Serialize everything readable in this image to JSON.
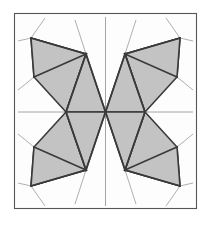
{
  "figure": {
    "name": "butterfly-crease-pattern",
    "width": 211,
    "height": 229,
    "background": "#ffffff"
  },
  "colors": {
    "background": "#ffffff",
    "sheet_fill": "#fdfdfd",
    "sheet_border": "#555555",
    "facet_fill": "#c3c3c3",
    "facet_stroke": "#3a3a3a",
    "fold_line": "#3a3a3a",
    "crease_thin": "#9a9a9a",
    "axis_line": "#8e8e8e"
  },
  "geometry": {
    "sheet": {
      "x": 14,
      "y": 13,
      "width": 183,
      "height": 196
    },
    "center": {
      "x": 105.5,
      "y": 112
    },
    "stroke_widths": {
      "sheet_border": 1.1,
      "facet": 1.6,
      "fold": 1.6,
      "crease_thin": 0.8,
      "axis": 0.8
    }
  },
  "facets": [
    {
      "name": "upper-left-outer-wing",
      "points": "31,38 86,54 34,77"
    },
    {
      "name": "upper-left-inner-wing",
      "points": "31,38 34,77 66,112 86,54"
    },
    {
      "name": "upper-left-center-fan",
      "points": "86,54 66,112 105.5,112"
    },
    {
      "name": "upper-right-outer-wing",
      "points": "180,38 125,54 177,77"
    },
    {
      "name": "upper-right-inner-wing",
      "points": "180,38 177,77 145,112 125,54"
    },
    {
      "name": "upper-right-center-fan",
      "points": "125,54 145,112 105.5,112"
    },
    {
      "name": "lower-left-outer-wing",
      "points": "31,186 86,170 34,147"
    },
    {
      "name": "lower-left-inner-wing",
      "points": "31,186 34,147 66,112 86,170"
    },
    {
      "name": "lower-left-center-fan",
      "points": "86,170 66,112 105.5,112"
    },
    {
      "name": "lower-right-outer-wing",
      "points": "180,186 125,170 177,147"
    },
    {
      "name": "lower-right-inner-wing",
      "points": "180,186 177,147 145,112 125,170"
    },
    {
      "name": "lower-right-center-fan",
      "points": "125,170 145,112 105.5,112"
    }
  ],
  "fold_lines": [
    {
      "name": "fold-ul-diagonal-a",
      "x1": 31,
      "y1": 38,
      "x2": 86,
      "y2": 54
    },
    {
      "name": "fold-ul-diagonal-b",
      "x1": 34,
      "y1": 77,
      "x2": 86,
      "y2": 54
    },
    {
      "name": "fold-ul-spine",
      "x1": 86,
      "y1": 54,
      "x2": 66,
      "y2": 112
    },
    {
      "name": "fold-ul-to-center",
      "x1": 86,
      "y1": 54,
      "x2": 105.5,
      "y2": 112
    },
    {
      "name": "fold-ur-diagonal-a",
      "x1": 180,
      "y1": 38,
      "x2": 125,
      "y2": 54
    },
    {
      "name": "fold-ur-diagonal-b",
      "x1": 177,
      "y1": 77,
      "x2": 125,
      "y2": 54
    },
    {
      "name": "fold-ur-spine",
      "x1": 125,
      "y1": 54,
      "x2": 145,
      "y2": 112
    },
    {
      "name": "fold-ur-to-center",
      "x1": 125,
      "y1": 54,
      "x2": 105.5,
      "y2": 112
    },
    {
      "name": "fold-ll-diagonal-a",
      "x1": 31,
      "y1": 186,
      "x2": 86,
      "y2": 170
    },
    {
      "name": "fold-ll-diagonal-b",
      "x1": 34,
      "y1": 147,
      "x2": 86,
      "y2": 170
    },
    {
      "name": "fold-ll-spine",
      "x1": 86,
      "y1": 170,
      "x2": 66,
      "y2": 112
    },
    {
      "name": "fold-ll-to-center",
      "x1": 86,
      "y1": 170,
      "x2": 105.5,
      "y2": 112
    },
    {
      "name": "fold-lr-diagonal-a",
      "x1": 180,
      "y1": 186,
      "x2": 125,
      "y2": 170
    },
    {
      "name": "fold-lr-diagonal-b",
      "x1": 177,
      "y1": 147,
      "x2": 125,
      "y2": 170
    },
    {
      "name": "fold-lr-spine",
      "x1": 125,
      "y1": 170,
      "x2": 145,
      "y2": 112
    },
    {
      "name": "fold-lr-to-center",
      "x1": 125,
      "y1": 170,
      "x2": 105.5,
      "y2": 112
    }
  ],
  "thin_creases": [
    {
      "name": "crease-top-left-outer",
      "x1": 31,
      "y1": 38,
      "x2": 45,
      "y2": 18
    },
    {
      "name": "crease-top-left-inner",
      "x1": 86,
      "y1": 54,
      "x2": 75,
      "y2": 20
    },
    {
      "name": "crease-top-right-inner",
      "x1": 125,
      "y1": 54,
      "x2": 136,
      "y2": 20
    },
    {
      "name": "crease-top-right-outer",
      "x1": 180,
      "y1": 38,
      "x2": 166,
      "y2": 18
    },
    {
      "name": "crease-left-upper-stub",
      "x1": 31,
      "y1": 38,
      "x2": 18,
      "y2": 41
    },
    {
      "name": "crease-right-upper-stub",
      "x1": 180,
      "y1": 38,
      "x2": 193,
      "y2": 41
    },
    {
      "name": "crease-left-mid-stub",
      "x1": 34,
      "y1": 77,
      "x2": 18,
      "y2": 90
    },
    {
      "name": "crease-right-mid-stub",
      "x1": 177,
      "y1": 77,
      "x2": 193,
      "y2": 90
    },
    {
      "name": "crease-left-lowmid-stub",
      "x1": 34,
      "y1": 147,
      "x2": 18,
      "y2": 134
    },
    {
      "name": "crease-right-lowmid-stub",
      "x1": 177,
      "y1": 147,
      "x2": 193,
      "y2": 134
    },
    {
      "name": "crease-bottom-left-outer",
      "x1": 31,
      "y1": 186,
      "x2": 45,
      "y2": 206
    },
    {
      "name": "crease-bottom-left-inner",
      "x1": 86,
      "y1": 170,
      "x2": 75,
      "y2": 204
    },
    {
      "name": "crease-bottom-right-inner",
      "x1": 125,
      "y1": 170,
      "x2": 136,
      "y2": 204
    },
    {
      "name": "crease-bottom-right-outer",
      "x1": 180,
      "y1": 186,
      "x2": 166,
      "y2": 206
    },
    {
      "name": "crease-left-lower-stub",
      "x1": 31,
      "y1": 186,
      "x2": 18,
      "y2": 183
    },
    {
      "name": "crease-right-lower-stub",
      "x1": 180,
      "y1": 186,
      "x2": 193,
      "y2": 183
    }
  ],
  "axis_lines": [
    {
      "name": "axis-vertical-upper",
      "x1": 105.5,
      "y1": 17,
      "x2": 105.5,
      "y2": 112
    },
    {
      "name": "axis-vertical-lower",
      "x1": 105.5,
      "y1": 112,
      "x2": 105.5,
      "y2": 206
    },
    {
      "name": "axis-horizontal-left",
      "x1": 18,
      "y1": 112,
      "x2": 66,
      "y2": 112
    },
    {
      "name": "axis-horizontal-right",
      "x1": 145,
      "y1": 112,
      "x2": 193,
      "y2": 112
    },
    {
      "name": "axis-horizontal-center",
      "x1": 66,
      "y1": 112,
      "x2": 145,
      "y2": 112
    }
  ]
}
